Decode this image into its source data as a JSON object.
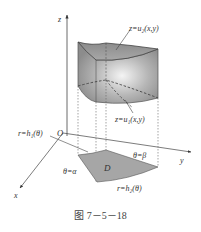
{
  "figure": {
    "caption": "图 7－5－18",
    "labels": {
      "z_axis": "z",
      "y_axis": "y",
      "x_axis": "x",
      "origin": "O",
      "upper_surface": "z=u₂(x,y)",
      "lower_surface": "z=u₁(x,y)",
      "inner_curve": "r=h₁(θ)",
      "outer_curve": "r=h₂(θ)",
      "ray_alpha": "θ=α",
      "ray_beta": "θ=β",
      "region": "D"
    },
    "colors": {
      "solid_fill": "#9a9a9a",
      "solid_highlight": "#f2f2f2",
      "region_fill": "#a8a8a8",
      "line": "#444444"
    }
  }
}
